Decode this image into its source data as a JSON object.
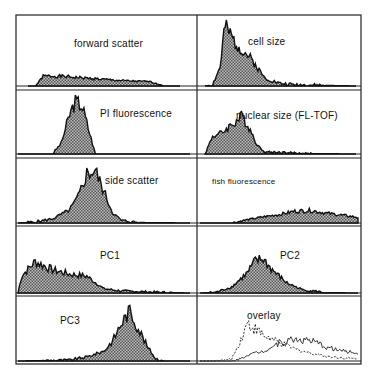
{
  "figure": {
    "background": "#ffffff",
    "ink": "#111111",
    "fill_color": "#8a8a8a"
  },
  "panels": [
    {
      "label": "forward scatter",
      "position": "row1-left"
    },
    {
      "label": "cell size",
      "position": "row1-right"
    },
    {
      "label": "PI fluorescence",
      "position": "row2-left"
    },
    {
      "label": "nuclear size (FL-TOF)",
      "position": "row2-right"
    },
    {
      "label": "side scatter",
      "position": "row3-left"
    },
    {
      "label": "fish fluorescence",
      "position": "row3-right"
    },
    {
      "label": "PC1",
      "position": "row4-left"
    },
    {
      "label": "PC2",
      "position": "row4-right"
    },
    {
      "label": "PC3",
      "position": "row5-left"
    },
    {
      "label": "overlay",
      "position": "row5-right"
    }
  ],
  "chart_data": [
    {
      "type": "area",
      "title": "forward scatter",
      "x": [
        0,
        0.05,
        0.1,
        0.2,
        0.3,
        0.4,
        0.5,
        0.6,
        0.7,
        0.8,
        0.9,
        1.0
      ],
      "values": [
        0,
        0,
        0.45,
        0.45,
        0.4,
        0.35,
        0.3,
        0.25,
        0.22,
        0.2,
        0,
        0
      ],
      "xlabel": "",
      "ylabel": "",
      "grid": false
    },
    {
      "type": "area",
      "title": "cell size",
      "x": [
        0,
        0.05,
        0.1,
        0.13,
        0.2,
        0.3,
        0.4,
        0.5,
        0.6,
        0.8,
        1.0
      ],
      "values": [
        0,
        0.02,
        0.3,
        0.95,
        0.7,
        0.45,
        0.12,
        0.04,
        0.02,
        0.01,
        0
      ],
      "xlabel": "",
      "ylabel": "",
      "grid": false
    },
    {
      "type": "area",
      "title": "PI fluorescence",
      "x": [
        0,
        0.2,
        0.25,
        0.3,
        0.33,
        0.37,
        0.4,
        0.45,
        1.0
      ],
      "values": [
        0,
        0,
        0.2,
        0.75,
        1.0,
        0.95,
        0.6,
        0,
        0
      ],
      "xlabel": "",
      "ylabel": "",
      "grid": false
    },
    {
      "type": "area",
      "title": "nuclear size (FL-TOF)",
      "x": [
        0,
        0.05,
        0.1,
        0.2,
        0.25,
        0.3,
        0.35,
        0.4,
        0.5,
        0.7,
        1.0
      ],
      "values": [
        0,
        0.45,
        0.5,
        0.8,
        0.95,
        0.6,
        0.2,
        0.05,
        0.04,
        0.01,
        0
      ],
      "xlabel": "",
      "ylabel": "",
      "grid": false
    },
    {
      "type": "area",
      "title": "side scatter",
      "x": [
        0,
        0.1,
        0.2,
        0.3,
        0.35,
        0.4,
        0.45,
        0.5,
        0.55,
        0.6,
        0.7,
        1.0
      ],
      "values": [
        0,
        0.02,
        0.08,
        0.25,
        0.5,
        0.95,
        1.0,
        0.6,
        0.2,
        0.05,
        0.01,
        0
      ],
      "xlabel": "",
      "ylabel": "",
      "grid": false
    },
    {
      "type": "area",
      "title": "fish fluorescence",
      "x": [
        0,
        0.2,
        0.3,
        0.4,
        0.5,
        0.6,
        0.7,
        0.8,
        0.9,
        1.0
      ],
      "values": [
        0,
        0,
        0.12,
        0.22,
        0.3,
        0.42,
        0.45,
        0.35,
        0.28,
        0.2
      ],
      "xlabel": "",
      "ylabel": "",
      "grid": false
    },
    {
      "type": "area",
      "title": "PC1",
      "x": [
        0,
        0.02,
        0.1,
        0.2,
        0.3,
        0.4,
        0.5,
        0.6,
        0.8,
        1.0
      ],
      "values": [
        0,
        0.4,
        0.75,
        0.55,
        0.45,
        0.4,
        0.1,
        0.05,
        0.02,
        0
      ],
      "xlabel": "",
      "ylabel": "",
      "grid": false
    },
    {
      "type": "area",
      "title": "PC2",
      "x": [
        0,
        0.1,
        0.2,
        0.3,
        0.35,
        0.4,
        0.45,
        0.55,
        0.65,
        0.8,
        1.0
      ],
      "values": [
        0,
        0.02,
        0.15,
        0.5,
        0.8,
        0.85,
        0.6,
        0.25,
        0.08,
        0.01,
        0
      ],
      "xlabel": "",
      "ylabel": "",
      "grid": false
    },
    {
      "type": "area",
      "title": "PC3",
      "x": [
        0,
        0.3,
        0.4,
        0.5,
        0.55,
        0.6,
        0.65,
        0.7,
        0.75,
        0.8,
        0.85,
        1.0
      ],
      "values": [
        0,
        0.02,
        0.08,
        0.2,
        0.4,
        0.75,
        1.0,
        0.65,
        0.3,
        0.05,
        0,
        0
      ],
      "xlabel": "",
      "ylabel": "",
      "grid": false
    },
    {
      "type": "line",
      "title": "overlay",
      "x": [
        0,
        0.1,
        0.2,
        0.25,
        0.3,
        0.4,
        0.5,
        0.6,
        0.7,
        0.8,
        0.9,
        1.0
      ],
      "series": [
        {
          "name": "cell size (dashed)",
          "values": [
            0,
            0,
            0.05,
            0.45,
            0.95,
            0.65,
            0.45,
            0.3,
            0.2,
            0.12,
            0.08,
            0.05
          ]
        },
        {
          "name": "fish fluorescence (solid)",
          "values": [
            0,
            0,
            0,
            0.05,
            0.15,
            0.25,
            0.45,
            0.55,
            0.5,
            0.35,
            0.25,
            0.2
          ]
        }
      ],
      "xlabel": "",
      "ylabel": "",
      "grid": false
    }
  ]
}
